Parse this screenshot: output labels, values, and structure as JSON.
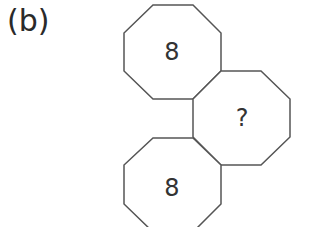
{
  "label": "(b)",
  "octagons": [
    {
      "position": "top",
      "value": "8"
    },
    {
      "position": "middle-right",
      "value": "?"
    },
    {
      "position": "bottom",
      "value": "8"
    }
  ],
  "colors": {
    "stroke": "#555555",
    "text": "#333333",
    "background": "#ffffff"
  }
}
